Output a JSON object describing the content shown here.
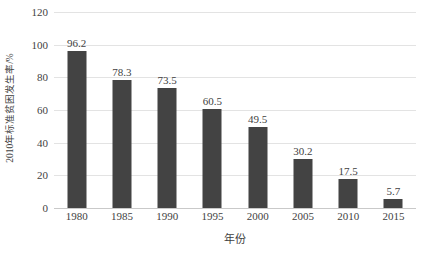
{
  "chart_data": {
    "type": "bar",
    "title": "",
    "subtitle": "",
    "xlabel": "年份",
    "ylabel": "2010年标准贫困发生率/%",
    "categories": [
      "1980",
      "1985",
      "1990",
      "1995",
      "2000",
      "2005",
      "2010",
      "2015"
    ],
    "values": [
      96.2,
      78.3,
      73.5,
      60.5,
      49.5,
      30.2,
      17.5,
      5.7
    ],
    "value_labels": [
      "96.2",
      "78.3",
      "73.5",
      "60.5",
      "49.5",
      "30.2",
      "17.5",
      "5.7"
    ],
    "ylim": [
      0,
      120
    ],
    "ytick_values": [
      0,
      20,
      40,
      60,
      80,
      100,
      120
    ],
    "ytick_labels": [
      "0",
      "20",
      "40",
      "60",
      "80",
      "100",
      "120"
    ],
    "grid": true,
    "grid_axis": "y",
    "legend": false,
    "legend_position": "none",
    "series": [
      {
        "name": "2010年标准贫困发生率/%",
        "values": [
          96.2,
          78.3,
          73.5,
          60.5,
          49.5,
          30.2,
          17.5,
          5.7
        ]
      }
    ],
    "colors": {
      "bar": "#434343",
      "background": "#ffffff",
      "gridline": "#e3e3e3",
      "axis": "#c9c9c9",
      "text": "#3f3f3f"
    }
  }
}
